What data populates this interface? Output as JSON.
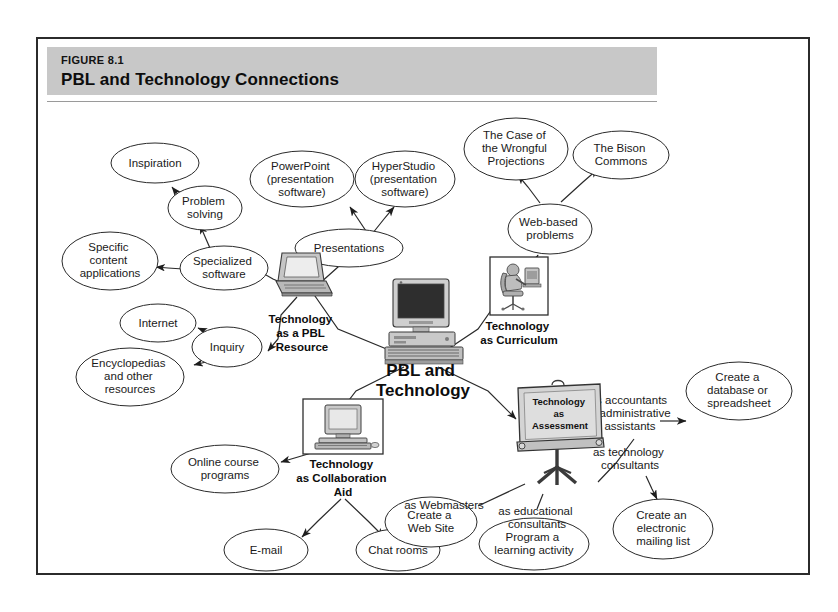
{
  "figure": {
    "number": "FIGURE 8.1",
    "title": "PBL and Technology Connections"
  },
  "center": {
    "label_line1": "PBL and",
    "label_line2": "Technology",
    "icon": "desktop-computer-icon"
  },
  "hubs": [
    {
      "id": "pbl-resource",
      "icon": "laptop-icon",
      "label_lines": [
        "Technology",
        "as a PBL",
        "Resource"
      ]
    },
    {
      "id": "curriculum",
      "icon": "person-at-computer-icon",
      "label_lines": [
        "Technology",
        "as Curriculum"
      ]
    },
    {
      "id": "collaboration-aid",
      "icon": "desktop-computer-icon",
      "label_lines": [
        "Technology",
        "as Collaboration",
        "Aid"
      ]
    },
    {
      "id": "assessment",
      "icon": "easel-flipchart-icon",
      "label_lines": [
        "Technology",
        "as",
        "Assessment"
      ]
    }
  ],
  "nodes": [
    {
      "id": "inspiration",
      "lines": [
        "Inspiration"
      ]
    },
    {
      "id": "problem-solving",
      "lines": [
        "Problem",
        "solving"
      ]
    },
    {
      "id": "specific-content-applications",
      "lines": [
        "Specific",
        "content",
        "applications"
      ]
    },
    {
      "id": "specialized-software",
      "lines": [
        "Specialized",
        "software"
      ]
    },
    {
      "id": "internet",
      "lines": [
        "Internet"
      ]
    },
    {
      "id": "inquiry",
      "lines": [
        "Inquiry"
      ]
    },
    {
      "id": "encyclopedias",
      "lines": [
        "Encyclopedias",
        "and other",
        "resources"
      ]
    },
    {
      "id": "powerpoint",
      "lines": [
        "PowerPoint",
        "(presentation",
        "software)"
      ]
    },
    {
      "id": "hyperstudio",
      "lines": [
        "HyperStudio",
        "(presentation",
        "software)"
      ]
    },
    {
      "id": "presentations",
      "lines": [
        "Presentations"
      ]
    },
    {
      "id": "wrongful-projections",
      "lines": [
        "The Case of",
        "the Wrongful",
        "Projections"
      ]
    },
    {
      "id": "bison-commons",
      "lines": [
        "The Bison",
        "Commons"
      ]
    },
    {
      "id": "web-based-problems",
      "lines": [
        "Web-based",
        "problems"
      ]
    },
    {
      "id": "online-course-programs",
      "lines": [
        "Online course",
        "programs"
      ]
    },
    {
      "id": "email",
      "lines": [
        "E-mail"
      ]
    },
    {
      "id": "chat-rooms",
      "lines": [
        "Chat rooms"
      ]
    },
    {
      "id": "create-web-site",
      "lines": [
        "Create a",
        "Web Site"
      ]
    },
    {
      "id": "program-learning-activity",
      "lines": [
        "Program a",
        "learning activity"
      ]
    },
    {
      "id": "create-database-spreadsheet",
      "lines": [
        "Create a",
        "database or",
        "spreadsheet"
      ]
    },
    {
      "id": "create-electronic-mailing-list",
      "lines": [
        "Create an",
        "electronic",
        "mailing list"
      ]
    }
  ],
  "edge_labels": [
    {
      "id": "as-webmasters",
      "lines": [
        "as Webmasters"
      ]
    },
    {
      "id": "as-educational-consultants",
      "lines": [
        "as educational",
        "consultants"
      ]
    },
    {
      "id": "as-accountants",
      "lines": [
        "as accountants",
        "or administrative",
        "assistants"
      ]
    },
    {
      "id": "as-technology-consultants",
      "lines": [
        "as technology",
        "consultants"
      ]
    }
  ],
  "colors": {
    "band": "#c8c8c8",
    "frame": "#2b2b2b",
    "stroke": "#2a2a2a",
    "text": "#1a1a1a",
    "page": "#ffffff"
  }
}
